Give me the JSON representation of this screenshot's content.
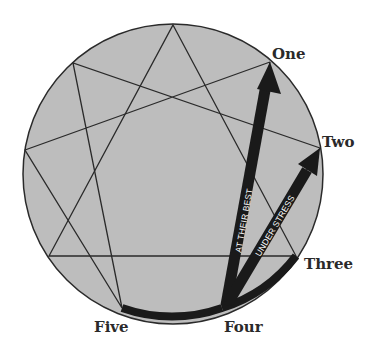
{
  "diagram": {
    "type": "enneagram",
    "colors": {
      "circle_fill": "#bdbdbd",
      "line": "#2a2a2a",
      "arrow": "#1a1a1a",
      "arrow_text": "#ffffff",
      "label": "#2a2a2a"
    },
    "labels": {
      "one": "One",
      "two": "Two",
      "three": "Three",
      "four": "Four",
      "five": "Five"
    },
    "arrows": {
      "best": "AT THEIR BEST",
      "stress": "UNDER STRESS"
    }
  }
}
